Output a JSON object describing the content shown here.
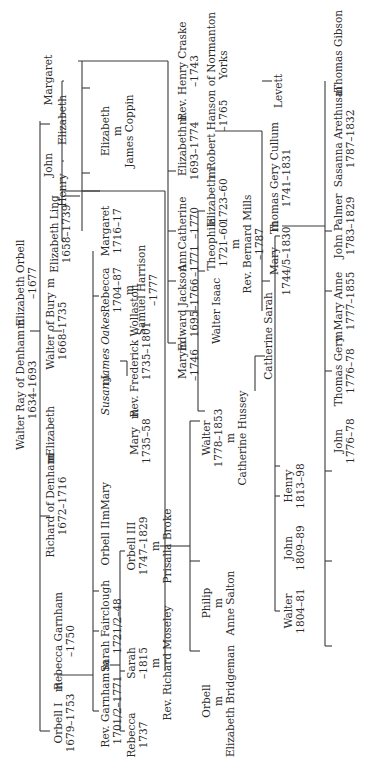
{
  "marriage_marker": "m",
  "people": {
    "walter_ray": {
      "name": "Walter Ray of Denham",
      "dates": "1634–1693"
    },
    "elizabeth_orbell": {
      "name": "Elizabeth Orbell",
      "dates": "–1677"
    },
    "orbell_i": {
      "name": "Orbell I",
      "dates": "1679–1753"
    },
    "rebecca_garnham": {
      "name": "Rebecca Garnham",
      "dates": "–1750"
    },
    "richard_of_denham": {
      "name": "Richard of Denham",
      "dates": "1672–1716"
    },
    "elizabeth_wife_richard": {
      "name": "Elizabeth"
    },
    "walter_of_bury": {
      "name": "Walter of Bury",
      "dates": "1668–1735"
    },
    "elizabeth_ling": {
      "name": "Elizabeth Ling",
      "dates": "1658–1739"
    },
    "henry": {
      "name": "Henry"
    },
    "john": {
      "name": "John"
    },
    "elizabeth_sib": {
      "name": "Elizabeth"
    },
    "margaret_sib": {
      "name": "Margaret"
    },
    "rev_garnham": {
      "name": "Rev. Garnham",
      "dates": "1701/2–1771"
    },
    "sarah_fairclough": {
      "name": "Sarah Fairclough",
      "dates": "1721/2–48"
    },
    "orbell_ii": {
      "name": "Orbell II"
    },
    "mary_wife_orbell_ii": {
      "name": "Mary"
    },
    "susan": {
      "name": "Susan"
    },
    "james_oakes": {
      "name": "James Oakes"
    },
    "rebecca_1704": {
      "name": "Rebecca",
      "dates": "1704–87",
      "spouse": "Samuel Harrison",
      "spouse_dates": "–1777"
    },
    "margaret_1716": {
      "name": "Margaret",
      "dates": "1716–17"
    },
    "elizabeth_coppin": {
      "name": "Elizabeth",
      "spouse": "James Coppin"
    },
    "rebecca_1737": {
      "name": "Rebecca",
      "dates": "1737"
    },
    "sarah_1815": {
      "name": "Sarah",
      "dates": "–1815",
      "spouse": "Rev. Richard Moseley"
    },
    "orbell_iii": {
      "name": "Orbell III",
      "dates": "1747–1829",
      "spouse": "Prisalla Broke"
    },
    "mary_1735": {
      "name": "Mary",
      "dates": "1735–58"
    },
    "rev_frederick_wollaston": {
      "name": "Rev. Frederick Wollaston",
      "dates": "1735–1801"
    },
    "mary_1746": {
      "name": "Mary",
      "dates": "–1746"
    },
    "edward_jackson": {
      "name": "Edward Jackson",
      "dates": "1695–1766"
    },
    "ann": {
      "name": "Ann",
      "dates": "–1771"
    },
    "catherine_1770": {
      "name": "Catherine",
      "dates": "–1770"
    },
    "elizabeth_1693": {
      "name": "Elizabeth",
      "dates": "1693–1774"
    },
    "rev_henry_craske": {
      "name": "Rev. Henry Craske",
      "dates": "–1743"
    },
    "walter_isaac": {
      "name": "Walter Isaac"
    },
    "theophila": {
      "name": "Theophila",
      "dates": "1721–60",
      "spouse": "Rev. Bernard Mills",
      "spouse_dates": "–1787"
    },
    "elizabeth_1723": {
      "name": "Elizabeth",
      "dates": "1723–60"
    },
    "robert_hanson": {
      "name": "Robert Hanson of Normanton",
      "place": "Yorks",
      "dates": "–1765"
    },
    "orbell_bridgeman": {
      "name": "Orbell",
      "spouse": "Elizabeth Bridgeman"
    },
    "philip": {
      "name": "Philip",
      "spouse": "Anne Salton"
    },
    "walter_1778": {
      "name": "Walter",
      "dates": "1778–1853",
      "spouse": "Catherine Hussey"
    },
    "catherine_sarah": {
      "name": "Catherine Sarah"
    },
    "mary_1744": {
      "name": "Mary",
      "dates": "1744/5–1830"
    },
    "thomas_gery_cullum": {
      "name": "Thomas Gery Cullum",
      "dates": "1741–1831"
    },
    "levett": {
      "name": "Levett"
    },
    "walter_1804": {
      "name": "Walter",
      "dates": "1804–81"
    },
    "john_1809": {
      "name": "John",
      "dates": "1809–89"
    },
    "henry_1813": {
      "name": "Henry",
      "dates": "1813–98"
    },
    "john_1776": {
      "name": "John",
      "dates": "1776–78"
    },
    "thomas_gery_1776": {
      "name": "Thomas Gery",
      "dates": "1776–78"
    },
    "mary_anne": {
      "name": "Mary Anne",
      "dates": "1777–1855"
    },
    "john_palmer": {
      "name": "John Palmer",
      "dates": "1783–1829"
    },
    "sasanna_arethusa": {
      "name": "Sasanna Arethusa",
      "dates": "1787–1832"
    },
    "thomas_gibson": {
      "name": "Thomas Gibson"
    }
  }
}
